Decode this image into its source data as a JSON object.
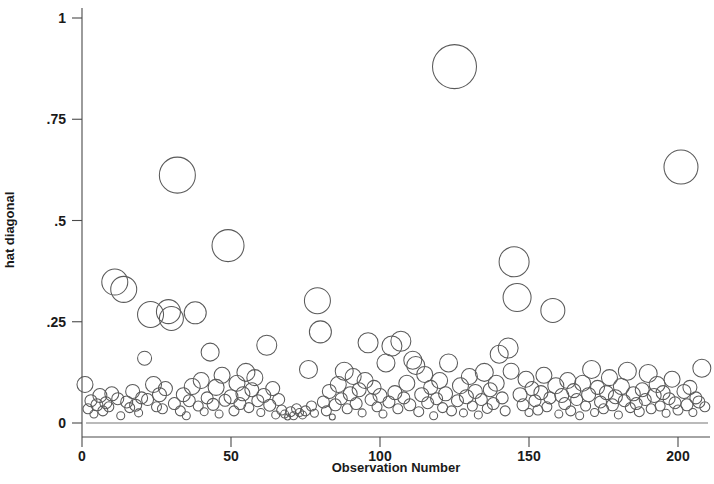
{
  "chart_data": {
    "type": "scatter",
    "title": "",
    "subtitle": "",
    "xlabel": "Observation Number",
    "ylabel": "hat diagonal",
    "xlim": [
      -3,
      212
    ],
    "ylim": [
      0,
      1.03
    ],
    "xticks": [
      0,
      50,
      100,
      150,
      200
    ],
    "xtick_labels": [
      "0",
      "50",
      "100",
      "150",
      "200"
    ],
    "yticks": [
      0,
      0.25,
      0.5,
      0.75,
      1
    ],
    "ytick_labels": [
      "0",
      ".25",
      ".5",
      ".75",
      "1"
    ],
    "grid": false,
    "legend": false,
    "marker": "open-circle",
    "marker_color": "#5a5a5a",
    "marker_fill": "none",
    "size_encoding": "bubble area proportional to weight",
    "reference_lines": [
      {
        "axis": "y",
        "value": 0,
        "color": "#777777"
      }
    ],
    "series": [
      {
        "name": "hat diagonal",
        "points": [
          {
            "x": 1,
            "y": 0.095,
            "r": 8
          },
          {
            "x": 2,
            "y": 0.035,
            "r": 5
          },
          {
            "x": 3,
            "y": 0.055,
            "r": 6
          },
          {
            "x": 4,
            "y": 0.022,
            "r": 4
          },
          {
            "x": 5,
            "y": 0.045,
            "r": 6
          },
          {
            "x": 6,
            "y": 0.068,
            "r": 7
          },
          {
            "x": 7,
            "y": 0.03,
            "r": 5
          },
          {
            "x": 8,
            "y": 0.05,
            "r": 6
          },
          {
            "x": 9,
            "y": 0.04,
            "r": 5
          },
          {
            "x": 10,
            "y": 0.072,
            "r": 7
          },
          {
            "x": 11,
            "y": 0.348,
            "r": 13
          },
          {
            "x": 12,
            "y": 0.06,
            "r": 6
          },
          {
            "x": 13,
            "y": 0.018,
            "r": 4
          },
          {
            "x": 14,
            "y": 0.33,
            "r": 13
          },
          {
            "x": 15,
            "y": 0.052,
            "r": 6
          },
          {
            "x": 16,
            "y": 0.038,
            "r": 5
          },
          {
            "x": 17,
            "y": 0.078,
            "r": 7
          },
          {
            "x": 18,
            "y": 0.044,
            "r": 6
          },
          {
            "x": 19,
            "y": 0.025,
            "r": 4
          },
          {
            "x": 20,
            "y": 0.062,
            "r": 6
          },
          {
            "x": 21,
            "y": 0.16,
            "r": 7
          },
          {
            "x": 22,
            "y": 0.058,
            "r": 6
          },
          {
            "x": 23,
            "y": 0.268,
            "r": 13
          },
          {
            "x": 24,
            "y": 0.095,
            "r": 8
          },
          {
            "x": 25,
            "y": 0.04,
            "r": 5
          },
          {
            "x": 26,
            "y": 0.07,
            "r": 7
          },
          {
            "x": 27,
            "y": 0.035,
            "r": 5
          },
          {
            "x": 28,
            "y": 0.085,
            "r": 7
          },
          {
            "x": 29,
            "y": 0.275,
            "r": 12
          },
          {
            "x": 30,
            "y": 0.258,
            "r": 12
          },
          {
            "x": 31,
            "y": 0.048,
            "r": 6
          },
          {
            "x": 32,
            "y": 0.612,
            "r": 18
          },
          {
            "x": 33,
            "y": 0.03,
            "r": 5
          },
          {
            "x": 34,
            "y": 0.07,
            "r": 7
          },
          {
            "x": 35,
            "y": 0.018,
            "r": 4
          },
          {
            "x": 36,
            "y": 0.055,
            "r": 6
          },
          {
            "x": 37,
            "y": 0.09,
            "r": 8
          },
          {
            "x": 38,
            "y": 0.272,
            "r": 11
          },
          {
            "x": 39,
            "y": 0.042,
            "r": 5
          },
          {
            "x": 40,
            "y": 0.105,
            "r": 8
          },
          {
            "x": 41,
            "y": 0.028,
            "r": 4
          },
          {
            "x": 42,
            "y": 0.062,
            "r": 6
          },
          {
            "x": 43,
            "y": 0.175,
            "r": 9
          },
          {
            "x": 44,
            "y": 0.046,
            "r": 6
          },
          {
            "x": 45,
            "y": 0.088,
            "r": 8
          },
          {
            "x": 46,
            "y": 0.022,
            "r": 4
          },
          {
            "x": 47,
            "y": 0.118,
            "r": 8
          },
          {
            "x": 48,
            "y": 0.056,
            "r": 6
          },
          {
            "x": 49,
            "y": 0.438,
            "r": 16
          },
          {
            "x": 50,
            "y": 0.065,
            "r": 7
          },
          {
            "x": 51,
            "y": 0.03,
            "r": 5
          },
          {
            "x": 52,
            "y": 0.098,
            "r": 8
          },
          {
            "x": 53,
            "y": 0.048,
            "r": 6
          },
          {
            "x": 54,
            "y": 0.072,
            "r": 7
          },
          {
            "x": 55,
            "y": 0.125,
            "r": 9
          },
          {
            "x": 56,
            "y": 0.038,
            "r": 5
          },
          {
            "x": 57,
            "y": 0.082,
            "r": 7
          },
          {
            "x": 58,
            "y": 0.112,
            "r": 8
          },
          {
            "x": 59,
            "y": 0.055,
            "r": 6
          },
          {
            "x": 60,
            "y": 0.026,
            "r": 4
          },
          {
            "x": 61,
            "y": 0.068,
            "r": 7
          },
          {
            "x": 62,
            "y": 0.192,
            "r": 10
          },
          {
            "x": 63,
            "y": 0.044,
            "r": 6
          },
          {
            "x": 64,
            "y": 0.085,
            "r": 7
          },
          {
            "x": 65,
            "y": 0.02,
            "r": 4
          },
          {
            "x": 66,
            "y": 0.058,
            "r": 6
          },
          {
            "x": 67,
            "y": 0.032,
            "r": 5
          },
          {
            "x": 68,
            "y": 0.022,
            "r": 4
          },
          {
            "x": 69,
            "y": 0.015,
            "r": 3
          },
          {
            "x": 70,
            "y": 0.028,
            "r": 5
          },
          {
            "x": 71,
            "y": 0.018,
            "r": 4
          },
          {
            "x": 72,
            "y": 0.035,
            "r": 5
          },
          {
            "x": 73,
            "y": 0.026,
            "r": 4
          },
          {
            "x": 74,
            "y": 0.02,
            "r": 4
          },
          {
            "x": 75,
            "y": 0.03,
            "r": 5
          },
          {
            "x": 76,
            "y": 0.132,
            "r": 9
          },
          {
            "x": 77,
            "y": 0.042,
            "r": 5
          },
          {
            "x": 78,
            "y": 0.024,
            "r": 4
          },
          {
            "x": 79,
            "y": 0.302,
            "r": 13
          },
          {
            "x": 80,
            "y": 0.225,
            "r": 11
          },
          {
            "x": 81,
            "y": 0.052,
            "r": 6
          },
          {
            "x": 82,
            "y": 0.03,
            "r": 5
          },
          {
            "x": 83,
            "y": 0.078,
            "r": 7
          },
          {
            "x": 84,
            "y": 0.015,
            "r": 3
          },
          {
            "x": 85,
            "y": 0.045,
            "r": 6
          },
          {
            "x": 86,
            "y": 0.095,
            "r": 8
          },
          {
            "x": 87,
            "y": 0.06,
            "r": 6
          },
          {
            "x": 88,
            "y": 0.128,
            "r": 9
          },
          {
            "x": 89,
            "y": 0.035,
            "r": 5
          },
          {
            "x": 90,
            "y": 0.072,
            "r": 7
          },
          {
            "x": 91,
            "y": 0.115,
            "r": 8
          },
          {
            "x": 92,
            "y": 0.048,
            "r": 6
          },
          {
            "x": 93,
            "y": 0.082,
            "r": 7
          },
          {
            "x": 94,
            "y": 0.025,
            "r": 4
          },
          {
            "x": 95,
            "y": 0.105,
            "r": 8
          },
          {
            "x": 96,
            "y": 0.198,
            "r": 10
          },
          {
            "x": 97,
            "y": 0.058,
            "r": 6
          },
          {
            "x": 98,
            "y": 0.088,
            "r": 7
          },
          {
            "x": 99,
            "y": 0.04,
            "r": 5
          },
          {
            "x": 100,
            "y": 0.068,
            "r": 7
          },
          {
            "x": 101,
            "y": 0.022,
            "r": 4
          },
          {
            "x": 102,
            "y": 0.148,
            "r": 9
          },
          {
            "x": 103,
            "y": 0.052,
            "r": 6
          },
          {
            "x": 104,
            "y": 0.19,
            "r": 10
          },
          {
            "x": 105,
            "y": 0.075,
            "r": 7
          },
          {
            "x": 106,
            "y": 0.035,
            "r": 5
          },
          {
            "x": 107,
            "y": 0.202,
            "r": 10
          },
          {
            "x": 108,
            "y": 0.062,
            "r": 6
          },
          {
            "x": 109,
            "y": 0.098,
            "r": 8
          },
          {
            "x": 110,
            "y": 0.045,
            "r": 6
          },
          {
            "x": 111,
            "y": 0.155,
            "r": 9
          },
          {
            "x": 112,
            "y": 0.142,
            "r": 9
          },
          {
            "x": 113,
            "y": 0.028,
            "r": 5
          },
          {
            "x": 114,
            "y": 0.07,
            "r": 7
          },
          {
            "x": 115,
            "y": 0.12,
            "r": 8
          },
          {
            "x": 116,
            "y": 0.05,
            "r": 6
          },
          {
            "x": 117,
            "y": 0.088,
            "r": 7
          },
          {
            "x": 118,
            "y": 0.018,
            "r": 4
          },
          {
            "x": 119,
            "y": 0.06,
            "r": 6
          },
          {
            "x": 120,
            "y": 0.105,
            "r": 8
          },
          {
            "x": 121,
            "y": 0.038,
            "r": 5
          },
          {
            "x": 122,
            "y": 0.072,
            "r": 7
          },
          {
            "x": 123,
            "y": 0.148,
            "r": 9
          },
          {
            "x": 124,
            "y": 0.03,
            "r": 5
          },
          {
            "x": 125,
            "y": 0.88,
            "r": 22
          },
          {
            "x": 126,
            "y": 0.055,
            "r": 6
          },
          {
            "x": 127,
            "y": 0.092,
            "r": 8
          },
          {
            "x": 128,
            "y": 0.025,
            "r": 4
          },
          {
            "x": 129,
            "y": 0.065,
            "r": 7
          },
          {
            "x": 130,
            "y": 0.115,
            "r": 8
          },
          {
            "x": 131,
            "y": 0.042,
            "r": 5
          },
          {
            "x": 132,
            "y": 0.078,
            "r": 7
          },
          {
            "x": 133,
            "y": 0.02,
            "r": 4
          },
          {
            "x": 134,
            "y": 0.058,
            "r": 6
          },
          {
            "x": 135,
            "y": 0.125,
            "r": 9
          },
          {
            "x": 136,
            "y": 0.036,
            "r": 5
          },
          {
            "x": 137,
            "y": 0.082,
            "r": 7
          },
          {
            "x": 138,
            "y": 0.048,
            "r": 6
          },
          {
            "x": 139,
            "y": 0.098,
            "r": 8
          },
          {
            "x": 140,
            "y": 0.17,
            "r": 9
          },
          {
            "x": 141,
            "y": 0.062,
            "r": 6
          },
          {
            "x": 142,
            "y": 0.03,
            "r": 5
          },
          {
            "x": 143,
            "y": 0.185,
            "r": 10
          },
          {
            "x": 144,
            "y": 0.128,
            "r": 8
          },
          {
            "x": 145,
            "y": 0.398,
            "r": 15
          },
          {
            "x": 146,
            "y": 0.31,
            "r": 14
          },
          {
            "x": 147,
            "y": 0.07,
            "r": 7
          },
          {
            "x": 148,
            "y": 0.045,
            "r": 6
          },
          {
            "x": 149,
            "y": 0.108,
            "r": 8
          },
          {
            "x": 150,
            "y": 0.026,
            "r": 4
          },
          {
            "x": 151,
            "y": 0.085,
            "r": 7
          },
          {
            "x": 152,
            "y": 0.055,
            "r": 6
          },
          {
            "x": 153,
            "y": 0.032,
            "r": 5
          },
          {
            "x": 154,
            "y": 0.075,
            "r": 7
          },
          {
            "x": 155,
            "y": 0.118,
            "r": 8
          },
          {
            "x": 156,
            "y": 0.04,
            "r": 5
          },
          {
            "x": 157,
            "y": 0.062,
            "r": 6
          },
          {
            "x": 158,
            "y": 0.278,
            "r": 12
          },
          {
            "x": 159,
            "y": 0.092,
            "r": 8
          },
          {
            "x": 160,
            "y": 0.022,
            "r": 4
          },
          {
            "x": 161,
            "y": 0.068,
            "r": 7
          },
          {
            "x": 162,
            "y": 0.048,
            "r": 6
          },
          {
            "x": 163,
            "y": 0.105,
            "r": 8
          },
          {
            "x": 164,
            "y": 0.03,
            "r": 5
          },
          {
            "x": 165,
            "y": 0.08,
            "r": 7
          },
          {
            "x": 166,
            "y": 0.058,
            "r": 6
          },
          {
            "x": 167,
            "y": 0.018,
            "r": 4
          },
          {
            "x": 168,
            "y": 0.098,
            "r": 8
          },
          {
            "x": 169,
            "y": 0.042,
            "r": 5
          },
          {
            "x": 170,
            "y": 0.07,
            "r": 7
          },
          {
            "x": 171,
            "y": 0.132,
            "r": 9
          },
          {
            "x": 172,
            "y": 0.026,
            "r": 4
          },
          {
            "x": 173,
            "y": 0.088,
            "r": 7
          },
          {
            "x": 174,
            "y": 0.052,
            "r": 6
          },
          {
            "x": 175,
            "y": 0.035,
            "r": 5
          },
          {
            "x": 176,
            "y": 0.075,
            "r": 7
          },
          {
            "x": 177,
            "y": 0.112,
            "r": 8
          },
          {
            "x": 178,
            "y": 0.045,
            "r": 6
          },
          {
            "x": 179,
            "y": 0.065,
            "r": 7
          },
          {
            "x": 180,
            "y": 0.02,
            "r": 4
          },
          {
            "x": 181,
            "y": 0.09,
            "r": 8
          },
          {
            "x": 182,
            "y": 0.055,
            "r": 6
          },
          {
            "x": 183,
            "y": 0.128,
            "r": 9
          },
          {
            "x": 184,
            "y": 0.038,
            "r": 5
          },
          {
            "x": 185,
            "y": 0.072,
            "r": 7
          },
          {
            "x": 186,
            "y": 0.048,
            "r": 6
          },
          {
            "x": 187,
            "y": 0.028,
            "r": 5
          },
          {
            "x": 188,
            "y": 0.082,
            "r": 7
          },
          {
            "x": 189,
            "y": 0.058,
            "r": 6
          },
          {
            "x": 190,
            "y": 0.122,
            "r": 9
          },
          {
            "x": 191,
            "y": 0.035,
            "r": 5
          },
          {
            "x": 192,
            "y": 0.068,
            "r": 7
          },
          {
            "x": 193,
            "y": 0.095,
            "r": 8
          },
          {
            "x": 194,
            "y": 0.042,
            "r": 5
          },
          {
            "x": 195,
            "y": 0.075,
            "r": 7
          },
          {
            "x": 196,
            "y": 0.024,
            "r": 4
          },
          {
            "x": 197,
            "y": 0.06,
            "r": 6
          },
          {
            "x": 198,
            "y": 0.108,
            "r": 8
          },
          {
            "x": 199,
            "y": 0.05,
            "r": 6
          },
          {
            "x": 200,
            "y": 0.032,
            "r": 5
          },
          {
            "x": 201,
            "y": 0.632,
            "r": 17
          },
          {
            "x": 202,
            "y": 0.078,
            "r": 7
          },
          {
            "x": 203,
            "y": 0.045,
            "r": 6
          },
          {
            "x": 204,
            "y": 0.088,
            "r": 7
          },
          {
            "x": 205,
            "y": 0.026,
            "r": 4
          },
          {
            "x": 206,
            "y": 0.062,
            "r": 6
          },
          {
            "x": 207,
            "y": 0.052,
            "r": 6
          },
          {
            "x": 208,
            "y": 0.135,
            "r": 9
          },
          {
            "x": 209,
            "y": 0.04,
            "r": 5
          }
        ]
      }
    ]
  },
  "plot": {
    "background_color": "#ffffff",
    "axis_color": "#4a4a4a",
    "text_color": "#1a1a1a"
  }
}
